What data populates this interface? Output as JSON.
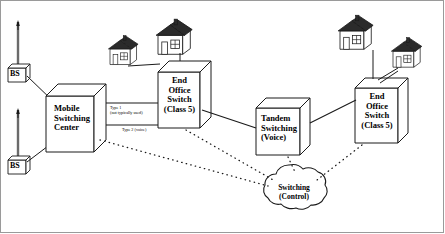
{
  "diagram": {
    "colors": {
      "line": "#1a1a1a",
      "frame": "#9a9a9a",
      "roof": "#2b2b2b",
      "fill": "#ffffff"
    },
    "nodes": {
      "msc": {
        "label_line1": "Mobile",
        "label_line2": "Switching",
        "label_line3": "Center"
      },
      "eo_left": {
        "label_line1": "End",
        "label_line2": "Office",
        "label_line3": "Switch",
        "label_line4": "(Class 5)"
      },
      "tandem": {
        "label_line1": "Tandem",
        "label_line2": "Switching",
        "label_line3": "(Voice)"
      },
      "eo_right": {
        "label_line1": "End",
        "label_line2": "Office",
        "label_line3": "Switch",
        "label_line4": "(Class 5)"
      },
      "cloud": {
        "label_line1": "Switching",
        "label_line2": "(Control)"
      },
      "bs_top": {
        "label": "BS"
      },
      "bs_bottom": {
        "label": "BS"
      }
    },
    "links": {
      "type1": {
        "line1": "Type 1",
        "line2": "(not typically used)"
      },
      "type2": {
        "line1": "Type 2 (voice)"
      }
    }
  }
}
